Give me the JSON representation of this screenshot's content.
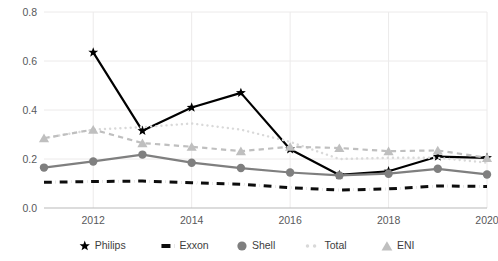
{
  "chart_data": {
    "type": "line",
    "title": "",
    "subtitle": "",
    "xlabel": "",
    "ylabel": "",
    "x": [
      2011,
      2012,
      2013,
      2014,
      2015,
      2016,
      2017,
      2018,
      2019,
      2020
    ],
    "xlim": [
      2011,
      2020
    ],
    "ylim": [
      0.0,
      0.8
    ],
    "grid": true,
    "gridlines_x": [
      2012,
      2014,
      2016,
      2018,
      2020
    ],
    "legend_position": "bottom",
    "y_ticks": [
      "0.0",
      "0.2",
      "0.4",
      "0.6",
      "0.8"
    ],
    "y_tick_values": [
      0.0,
      0.2,
      0.4,
      0.6,
      0.8
    ],
    "x_ticks": [
      "2012",
      "2014",
      "2016",
      "2018",
      "2020"
    ],
    "x_tick_values": [
      2012,
      2014,
      2016,
      2018,
      2020
    ],
    "series": [
      {
        "name": "Philips",
        "color": "#000000",
        "marker": "star",
        "dash": "solid",
        "values": [
          null,
          0.635,
          0.315,
          0.41,
          0.47,
          0.24,
          0.135,
          0.15,
          0.21,
          0.205
        ]
      },
      {
        "name": "Exxon",
        "color": "#0d0d0d",
        "marker": "none",
        "dash": "dash-dot",
        "values": [
          0.105,
          0.108,
          0.11,
          0.103,
          0.097,
          0.083,
          0.073,
          0.078,
          0.09,
          0.088
        ]
      },
      {
        "name": "Shell",
        "color": "#7f7f7f",
        "marker": "circle",
        "dash": "solid",
        "values": [
          0.165,
          0.19,
          0.218,
          0.185,
          0.163,
          0.145,
          0.133,
          0.14,
          0.16,
          0.137
        ]
      },
      {
        "name": "Total",
        "color": "#d9d9d9",
        "marker": "dot",
        "dash": "dotted",
        "values": [
          0.285,
          0.32,
          0.33,
          0.345,
          0.32,
          0.27,
          0.2,
          0.205,
          0.205,
          0.185
        ]
      },
      {
        "name": "ENI",
        "color": "#bfbfbf",
        "marker": "triangle",
        "dash": "dashed",
        "values": [
          0.285,
          0.32,
          0.265,
          0.25,
          0.232,
          0.25,
          0.245,
          0.232,
          0.235,
          0.205
        ]
      }
    ]
  },
  "legend": {
    "items": [
      {
        "label": "Philips",
        "marker": "star-icon"
      },
      {
        "label": "Exxon",
        "marker": "dash-dot-icon"
      },
      {
        "label": "Shell",
        "marker": "circle-icon"
      },
      {
        "label": "Total",
        "marker": "dotted-icon"
      },
      {
        "label": "ENI",
        "marker": "triangle-icon"
      }
    ]
  },
  "colors": {
    "philips": "#000000",
    "exxon": "#0d0d0d",
    "shell": "#7f7f7f",
    "total": "#d9d9d9",
    "eni": "#bfbfbf",
    "grid": "#eceaea",
    "axis": "#b9b9b9",
    "tick_text": "#58595b"
  }
}
